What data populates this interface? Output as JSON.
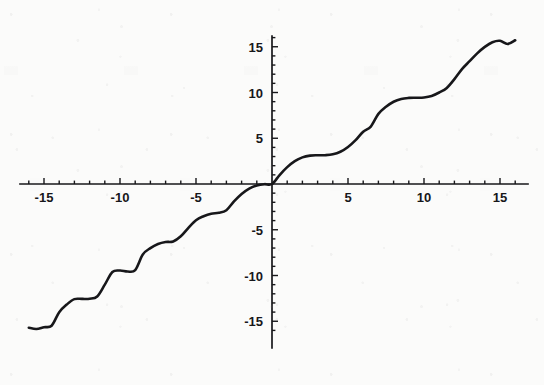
{
  "figure": {
    "background_color": "#fbfbfa",
    "ink_color": "#17171a",
    "width": 544,
    "height": 385
  },
  "chart_data": {
    "type": "line",
    "title": "",
    "subtitle": "",
    "xlabel": "",
    "ylabel": "",
    "expression": "y = x + sin(x)",
    "xlim": [
      -16.2,
      16.2
    ],
    "ylim": [
      -16.5,
      16.5
    ],
    "grid": false,
    "legend": null,
    "legend_position": "none",
    "axis_style": "crossed-at-origin",
    "line_color": "#17171a",
    "line_width": 2.6,
    "x_tick_labels": [
      "-15",
      "-10",
      "-5",
      "5",
      "10",
      "15"
    ],
    "x_tick_values": [
      -15,
      -10,
      -5,
      5,
      10,
      15
    ],
    "x_minor_tick_step": 1,
    "y_tick_labels": [
      "15",
      "10",
      "5",
      "-5",
      "-10",
      "-15"
    ],
    "y_tick_values": [
      15,
      10,
      5,
      -5,
      -10,
      -15
    ],
    "y_minor_tick_step": 1,
    "x": [
      -16.0,
      -15.5,
      -15.0,
      -14.5,
      -14.0,
      -13.5,
      -13.0,
      -12.5,
      -12.0,
      -11.5,
      -11.0,
      -10.5,
      -10.0,
      -9.5,
      -9.0,
      -8.5,
      -8.0,
      -7.5,
      -7.0,
      -6.5,
      -6.0,
      -5.5,
      -5.0,
      -4.5,
      -4.0,
      -3.5,
      -3.0,
      -2.5,
      -2.0,
      -1.5,
      -1.0,
      -0.5,
      0.0,
      0.5,
      1.0,
      1.5,
      2.0,
      2.5,
      3.0,
      3.5,
      4.0,
      4.5,
      5.0,
      5.5,
      6.0,
      6.5,
      7.0,
      7.5,
      8.0,
      8.5,
      9.0,
      9.5,
      10.0,
      10.5,
      11.0,
      11.5,
      12.0,
      12.5,
      13.0,
      13.5,
      14.0,
      14.5,
      15.0,
      15.5,
      16.0
    ],
    "y": [
      -15.71,
      -15.84,
      -15.65,
      -15.49,
      -14.01,
      -13.17,
      -12.58,
      -12.56,
      -12.54,
      -12.29,
      -11.0,
      -9.62,
      -9.46,
      -9.57,
      -9.41,
      -7.7,
      -7.01,
      -6.56,
      -6.34,
      -6.28,
      -5.72,
      -4.79,
      -3.96,
      -3.52,
      -3.24,
      -3.15,
      -2.86,
      -1.9,
      -1.09,
      -0.5,
      -0.16,
      -0.02,
      0.0,
      0.98,
      1.84,
      2.5,
      2.91,
      3.1,
      3.14,
      3.15,
      3.24,
      3.52,
      4.04,
      4.79,
      5.72,
      6.28,
      7.66,
      8.44,
      8.99,
      9.3,
      9.41,
      9.43,
      9.46,
      9.62,
      10.0,
      10.5,
      11.46,
      12.56,
      13.42,
      14.28,
      14.99,
      15.5,
      15.65,
      15.3,
      15.71
    ]
  },
  "annotations": {
    "header_artifact": ""
  }
}
